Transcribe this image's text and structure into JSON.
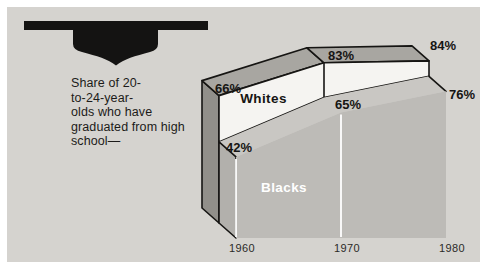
{
  "panel": {
    "background": "#d5d3cf",
    "outer_background": "#ffffff"
  },
  "icon": {
    "name": "graduation-cap",
    "color": "#141312"
  },
  "caption": {
    "lines": [
      "Share of 20-",
      "to-24-year-",
      "olds who have",
      "graduated from high",
      "school—"
    ]
  },
  "chart_data": {
    "type": "area",
    "style": "3d-layered-ribbon-area",
    "categories": [
      "1960",
      "1970",
      "1980"
    ],
    "x": [
      1960,
      1970,
      1980
    ],
    "unit": "%",
    "ylim": [
      0,
      100
    ],
    "grid": "vertical white gridlines at 1960 and 1970",
    "legend_position": "labels printed inside areas",
    "series": [
      {
        "name": "Whites",
        "values": [
          66,
          83,
          84
        ],
        "point_labels": [
          "66%",
          "83%",
          "84%"
        ],
        "area_color": "#f5f4f1",
        "top_color": "#a8a6a1",
        "side_color": "#918f8a",
        "name_label_color": "#161513"
      },
      {
        "name": "Blacks",
        "values": [
          42,
          65,
          76
        ],
        "point_labels": [
          "42%",
          "65%",
          "76%"
        ],
        "area_color": "#bdbbb7",
        "top_color": "#c9c7c3",
        "side_color": "#b2b0ac",
        "name_label_color": "#ffffff"
      }
    ],
    "colors": {
      "outline": "#161513",
      "gridline": "#ffffff",
      "background": "#d5d3cf"
    }
  }
}
